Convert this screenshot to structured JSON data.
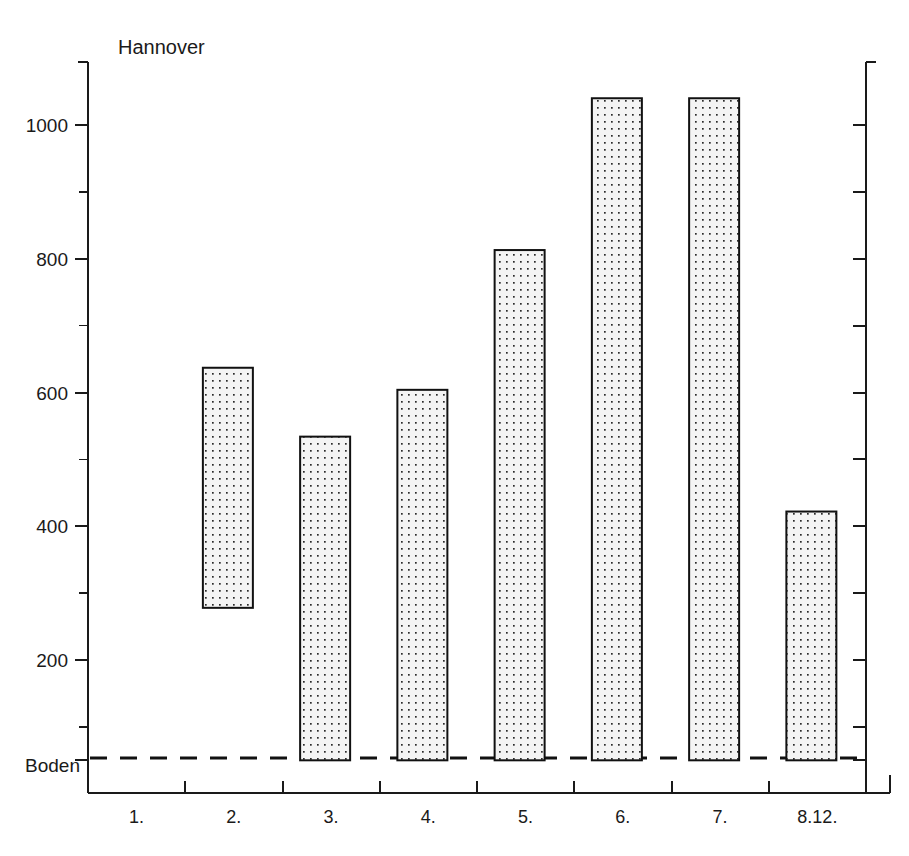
{
  "chart_data": {
    "type": "bar",
    "title": "Hannover",
    "xlabel": "",
    "ylabel": "",
    "categories": [
      "1.",
      "2.",
      "3.",
      "4.",
      "5.",
      "6.",
      "7.",
      "8.12."
    ],
    "values": [
      null,
      637,
      534,
      604,
      813,
      1040,
      1040,
      422
    ],
    "bar_bases": [
      null,
      278,
      50,
      50,
      50,
      50,
      50,
      50
    ],
    "ylim": [
      0,
      1100
    ],
    "y_major_ticks": [
      200,
      400,
      600,
      800,
      1000
    ],
    "y_major_tick_labels": [
      "200",
      "400",
      "600",
      "800",
      "1000"
    ],
    "y_minor_ticks": [
      100,
      300,
      500,
      700,
      900,
      1100
    ],
    "baseline_label": "Boden",
    "baseline_value": 50,
    "grid": false,
    "legend": null
  },
  "axes": {
    "left_axis_name": "left-value-axis",
    "right_axis_name": "right-value-axis",
    "bottom_axis_name": "category-axis"
  },
  "colors": {
    "ink": "#1a1a1a",
    "bar_stroke": "#111111",
    "bar_fill": "#f2f2f2",
    "dot": "#2b2b2b",
    "background": "#ffffff"
  },
  "icons": {
    "bar_pattern": "dotted-stipple-pattern"
  }
}
